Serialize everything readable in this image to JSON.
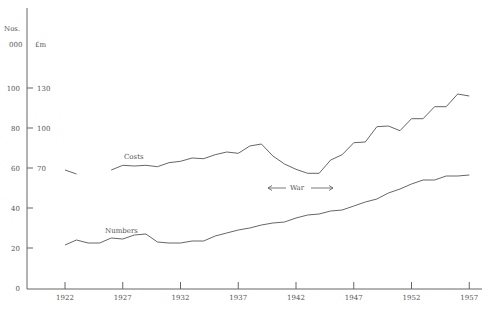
{
  "chart_data": {
    "type": "line",
    "title": "",
    "xlabel": "",
    "ylabel_left": "Nos. 000",
    "ylabel_right": "£m",
    "x_ticks": [
      1922,
      1927,
      1932,
      1937,
      1942,
      1947,
      1952,
      1957
    ],
    "y_ticks_numbers": [
      0,
      20,
      40,
      60,
      80,
      100
    ],
    "y_ticks_costs": [
      70,
      100,
      130
    ],
    "xlim": [
      1919,
      1958
    ],
    "ylim_numbers": [
      0,
      120
    ],
    "grid": false,
    "annotations": [
      {
        "text": "Costs",
        "near_year": 1928
      },
      {
        "text": "Numbers",
        "near_year": 1926
      },
      {
        "text": "War",
        "span": [
          1939,
          1945
        ],
        "arrows": true
      }
    ],
    "series": [
      {
        "name": "Costs",
        "axis": "£m",
        "segments": [
          {
            "x": [
              1922,
              1923
            ],
            "values": [
              68.5,
              65.5
            ]
          },
          {
            "x": [
              1926,
              1927,
              1928,
              1929,
              1930,
              1931,
              1932,
              1933,
              1934,
              1935,
              1936,
              1937,
              1938,
              1939,
              1940,
              1941,
              1942,
              1943,
              1944,
              1945,
              1946,
              1947,
              1948,
              1949,
              1950,
              1951,
              1952,
              1953,
              1954,
              1955,
              1956,
              1957
            ],
            "values": [
              68.5,
              72,
              71.5,
              72,
              71,
              74,
              75,
              77.5,
              77,
              80,
              82,
              81,
              86.5,
              88,
              79,
              73,
              69,
              66,
              66,
              76,
              80,
              89,
              89.5,
              101,
              101.5,
              98,
              107,
              107,
              116,
              116,
              125.5,
              124
            ]
          }
        ]
      },
      {
        "name": "Numbers",
        "axis": "Nos. 000",
        "segments": [
          {
            "x": [
              1922,
              1923,
              1924,
              1925,
              1926,
              1927,
              1928,
              1929,
              1930,
              1931,
              1932,
              1933,
              1934,
              1935,
              1936,
              1937,
              1938,
              1939,
              1940,
              1941,
              1942,
              1943,
              1944,
              1945,
              1946,
              1947,
              1948,
              1949,
              1950,
              1951,
              1952,
              1953,
              1954,
              1955,
              1956,
              1957
            ],
            "values": [
              21.5,
              24,
              22.5,
              22.5,
              25,
              24.5,
              26.5,
              27,
              23,
              22.5,
              22.5,
              23.5,
              23.5,
              26,
              27.5,
              29,
              30,
              31.5,
              32.5,
              33,
              35,
              36.5,
              37,
              38.5,
              39,
              41,
              43,
              44.5,
              47.5,
              49.5,
              52,
              54,
              54,
              56,
              56,
              56.5
            ]
          }
        ]
      }
    ]
  },
  "labels": {
    "nos": "Nos.",
    "thousands": "000",
    "pounds": "£m",
    "costs": "Costs",
    "numbers": "Numbers",
    "war": "War"
  },
  "colors": {
    "line": "#555555",
    "axis": "#666666",
    "text": "#555555"
  }
}
